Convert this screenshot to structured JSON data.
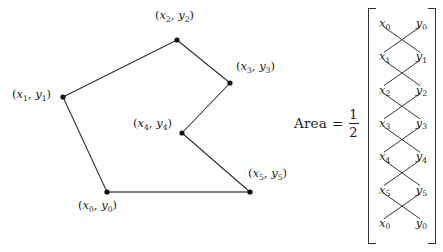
{
  "figure": {
    "polygon": {
      "stroke_color": "#2b2b2b",
      "fill_color": "none",
      "vertex_color": "#111111",
      "closing_edge_color": "#555555",
      "vertices": [
        {
          "id": "v0",
          "var_x": "x",
          "var_y": "y",
          "index": "0",
          "label": "(x_0, y_0)",
          "px": 107,
          "py": 192,
          "label_x": 78,
          "label_y": 200,
          "label_anchor": "start"
        },
        {
          "id": "v1",
          "var_x": "x",
          "var_y": "y",
          "index": "1",
          "label": "(x_1, y_1)",
          "px": 63,
          "py": 97,
          "label_x": 12,
          "label_y": 89,
          "label_anchor": "end"
        },
        {
          "id": "v2",
          "var_x": "x",
          "var_y": "y",
          "index": "2",
          "label": "(x_2, y_2)",
          "px": 177,
          "py": 40,
          "label_x": 155,
          "label_y": 10,
          "label_anchor": "start"
        },
        {
          "id": "v3",
          "var_x": "x",
          "var_y": "y",
          "index": "3",
          "label": "(x_3, y_3)",
          "px": 230,
          "py": 83,
          "label_x": 236,
          "label_y": 61,
          "label_anchor": "start"
        },
        {
          "id": "v4",
          "var_x": "x",
          "var_y": "y",
          "index": "4",
          "label": "(x_4, y_4)",
          "px": 182,
          "py": 133,
          "label_x": 133,
          "label_y": 118,
          "label_anchor": "end"
        },
        {
          "id": "v5",
          "var_x": "x",
          "var_y": "y",
          "index": "5",
          "label": "(x_5, y_5)",
          "px": 250,
          "py": 192,
          "label_x": 248,
          "label_y": 168,
          "label_anchor": "start"
        }
      ]
    }
  },
  "formula": {
    "area_label": "Area",
    "equals": "=",
    "fraction": {
      "numerator": "1",
      "denominator": "2"
    },
    "matrix": {
      "bracket_color": "#333333",
      "cross_line_color": "#333333",
      "column_headers": [
        "x",
        "y"
      ],
      "rows": [
        {
          "x_var": "x",
          "x_sub": "0",
          "y_var": "y",
          "y_sub": "0"
        },
        {
          "x_var": "x",
          "x_sub": "1",
          "y_var": "y",
          "y_sub": "1"
        },
        {
          "x_var": "x",
          "x_sub": "2",
          "y_var": "y",
          "y_sub": "2"
        },
        {
          "x_var": "x",
          "x_sub": "3",
          "y_var": "y",
          "y_sub": "3"
        },
        {
          "x_var": "x",
          "x_sub": "4",
          "y_var": "y",
          "y_sub": "4"
        },
        {
          "x_var": "x",
          "x_sub": "5",
          "y_var": "y",
          "y_sub": "5"
        },
        {
          "x_var": "x",
          "x_sub": "0",
          "y_var": "y",
          "y_sub": "0"
        }
      ]
    }
  }
}
